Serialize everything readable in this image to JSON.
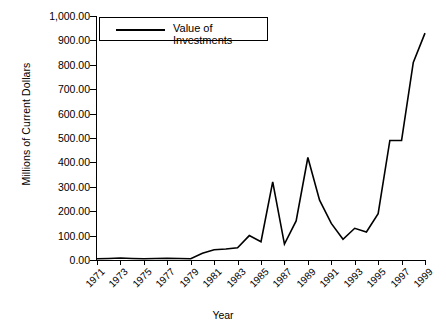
{
  "chart_data": {
    "type": "line",
    "title": "",
    "xlabel": "Year",
    "ylabel": "Millions of Current Dollars",
    "legend_position": "top-left",
    "grid": false,
    "xlim": [
      1971,
      1999
    ],
    "ylim": [
      0,
      1000
    ],
    "ytick_labels": [
      "0.00",
      "100.00",
      "200.00",
      "300.00",
      "400.00",
      "500.00",
      "600.00",
      "700.00",
      "800.00",
      "900.00",
      "1,000.00"
    ],
    "ytick_values": [
      0,
      100,
      200,
      300,
      400,
      500,
      600,
      700,
      800,
      900,
      1000
    ],
    "xtick_labels": [
      "1971",
      "1973",
      "1975",
      "1977",
      "1979",
      "1981",
      "1983",
      "1985",
      "1987",
      "1989",
      "1991",
      "1993",
      "1995",
      "1997",
      "1999"
    ],
    "xtick_values": [
      1971,
      1973,
      1975,
      1977,
      1979,
      1981,
      1983,
      1985,
      1987,
      1989,
      1991,
      1993,
      1995,
      1997,
      1999
    ],
    "series": [
      {
        "name": "Value of Investments",
        "color": "#000000",
        "x": [
          1971,
          1972,
          1973,
          1974,
          1975,
          1976,
          1977,
          1978,
          1979,
          1980,
          1981,
          1982,
          1983,
          1984,
          1985,
          1986,
          1987,
          1988,
          1989,
          1990,
          1991,
          1992,
          1993,
          1994,
          1995,
          1996,
          1997,
          1998,
          1999
        ],
        "values": [
          5,
          6,
          8,
          6,
          5,
          6,
          7,
          6,
          5,
          28,
          42,
          45,
          50,
          100,
          75,
          320,
          65,
          160,
          420,
          245,
          150,
          85,
          130,
          115,
          190,
          490,
          490,
          810,
          930
        ]
      }
    ]
  },
  "legend": {
    "entries": [
      {
        "label": "Value of Investments",
        "swatch": "line"
      }
    ]
  },
  "axes": {
    "x_title": "Year",
    "y_title": "Millions of Current Dollars"
  }
}
